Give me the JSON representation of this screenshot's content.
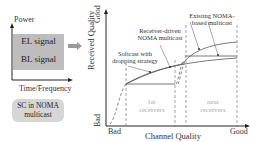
{
  "left_panel": {
    "y_axis_label": "Power",
    "x_axis_label": "Time/Frequency",
    "el_signal": "EL signal",
    "bl_signal": "BL signal",
    "caption_line1": "SC in NOMA",
    "caption_line2": "multicast"
  },
  "right_panel": {
    "y_axis_label": "Received Quality",
    "y_top": "Good",
    "y_bottom": "Bad",
    "x_axis_label": "Channel Quality",
    "x_left": "Bad",
    "x_right": "Good",
    "region_far_line1": "far",
    "region_far_line2": "receivers",
    "region_near_line1": "near",
    "region_near_line2": "receivers",
    "annotations": {
      "existing_line1": "Existing NOMA-",
      "existing_line2": "based multicast",
      "receiver_line1": "Receiver-driven",
      "receiver_line2": "NOMA multicast",
      "softcast_line1": "Softcast with",
      "softcast_line2": "dropping strategy"
    }
  },
  "colors": {
    "signal_fill": "#bdbdbd",
    "pill_fill": "#d6d6d6",
    "arrow": "#9a9a9a",
    "curve": "#555555",
    "region_text": "#aaaaaa"
  }
}
